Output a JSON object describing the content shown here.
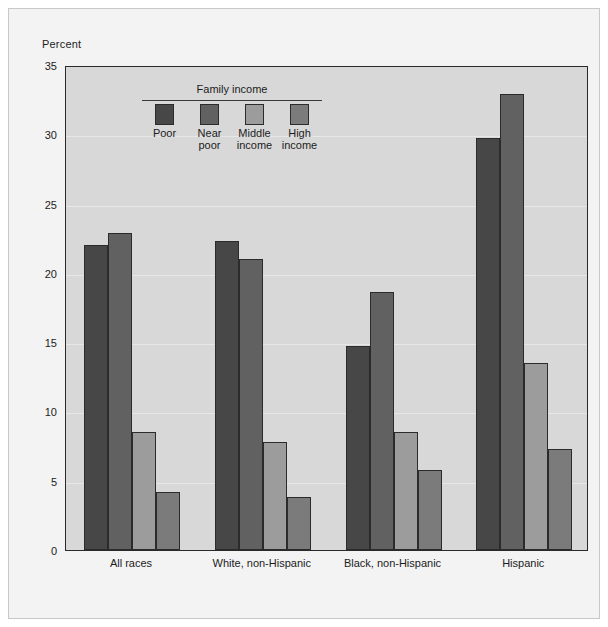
{
  "figure": {
    "axis_caption": "Percent",
    "legend_title": "Family income"
  },
  "legend": {
    "items": [
      {
        "label": "Poor",
        "color": "#474747"
      },
      {
        "label": "Near\npoor",
        "color": "#616161"
      },
      {
        "label": "Middle\nincome",
        "color": "#9c9c9c"
      },
      {
        "label": "High\nincome",
        "color": "#7b7b7b"
      }
    ]
  },
  "y_axis": {
    "ticks": [
      "0",
      "5",
      "10",
      "15",
      "20",
      "25",
      "30",
      "35"
    ]
  },
  "chart_data": {
    "type": "bar",
    "title": "",
    "xlabel": "",
    "ylabel": "Percent",
    "ylim": [
      0,
      35
    ],
    "ytick_step": 5,
    "grid": true,
    "legend_position": "inside-top-left",
    "legend_title": "Family income",
    "categories": [
      "All races",
      "White, non-Hispanic",
      "Black, non-Hispanic",
      "Hispanic"
    ],
    "series": [
      {
        "name": "Poor",
        "color": "#474747",
        "values": [
          22.0,
          22.3,
          14.7,
          29.7
        ]
      },
      {
        "name": "Near poor",
        "color": "#616161",
        "values": [
          22.9,
          21.0,
          18.6,
          32.9
        ]
      },
      {
        "name": "Middle income",
        "color": "#9c9c9c",
        "values": [
          8.5,
          7.8,
          8.5,
          13.5
        ]
      },
      {
        "name": "High income",
        "color": "#7b7b7b",
        "values": [
          4.2,
          3.8,
          5.8,
          7.3
        ]
      }
    ]
  },
  "colors": {
    "page_background": "#ffffff",
    "card_background": "#f3f3f3",
    "plot_background": "#d8d8d8",
    "frame_border": "#2a2a2a",
    "text": "#1c1c1c"
  }
}
